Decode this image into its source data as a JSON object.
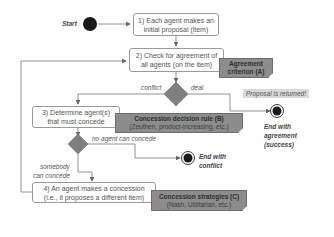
{
  "start": {
    "label": "Start"
  },
  "steps": [
    {
      "id": "step1",
      "text": "1) Each agent makes an\ninitial proposal (item)"
    },
    {
      "id": "step2",
      "text": "2) Check for agreement of\nall agents (on the item)"
    },
    {
      "id": "step3",
      "text": "3) Determine agent(s)\nthat must concede"
    },
    {
      "id": "step4",
      "text": "4) An agent makes a concession\n(i.e., it proposes a different item)"
    }
  ],
  "notes": {
    "agreement": {
      "title": "Agreement",
      "title2": "criterion (A)"
    },
    "decision_rule": {
      "title": "Concession decision rule (B)",
      "sub": "(Zeuthen, product-increasing, etc.)"
    },
    "strategies": {
      "title": "Concession strategies (C)",
      "sub": "(Nash, Utilitarian, etc.)"
    }
  },
  "edge_labels": {
    "conflict": "conflict",
    "deal": "deal",
    "no_agent": "no agent can concede",
    "somebody": "somebody\ncan concede"
  },
  "proposal_returned": "Proposal is returned!",
  "ends": {
    "agreement": "End with\nagreement\n(success)",
    "conflict": "End with\nconflict"
  },
  "colors": {
    "diamond": "#7f7f7f",
    "note": "#8c8c8c",
    "edge": "#666666",
    "node": "#1a1a1a"
  }
}
